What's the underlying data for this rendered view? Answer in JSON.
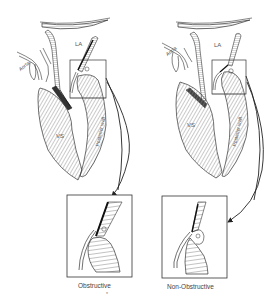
{
  "figure": {
    "panels": [
      {
        "id": "obstructive",
        "labels": {
          "left_atrium": "LA",
          "aorta": "Aorta",
          "ventricular_septum": "VS",
          "posterior_wall": "Posterior wall"
        },
        "caption": "Obstructive"
      },
      {
        "id": "non_obstructive",
        "labels": {
          "left_atrium": "LA",
          "aorta": "Aorta",
          "ventricular_septum": "VS",
          "posterior_wall": "Posterior wall"
        },
        "caption": "Non-Obstructive"
      }
    ],
    "footnote_mark": "*",
    "colors": {
      "line": "#222222",
      "hatch": "#888888",
      "background": "#ffffff"
    }
  }
}
